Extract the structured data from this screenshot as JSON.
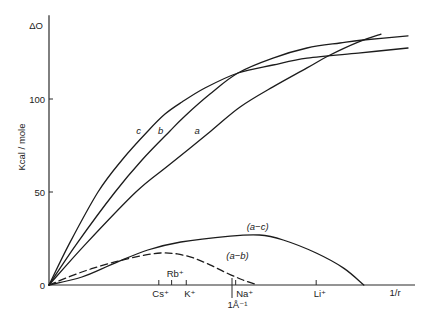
{
  "chart_data": {
    "type": "line",
    "title": "",
    "xlabel": "1/r",
    "ylabel": "Kcal / mole",
    "y_top_label": "ΔO",
    "xlim": [
      0,
      2.0
    ],
    "ylim": [
      0,
      145
    ],
    "grid": false,
    "legend": "none (curves labeled inline)",
    "y_ticks": [
      {
        "value": 0,
        "label": "0"
      },
      {
        "value": 50,
        "label": "50"
      },
      {
        "value": 100,
        "label": "100"
      }
    ],
    "x_markers": [
      {
        "label": "Cs⁺",
        "x": 0.6,
        "label_x": 0.61,
        "label_pos": "below",
        "long": false
      },
      {
        "label": "Rb⁺",
        "x": 0.67,
        "label_x": 0.69,
        "label_pos": "above",
        "long": false
      },
      {
        "label": "K⁺",
        "x": 0.75,
        "label_x": 0.77,
        "label_pos": "below",
        "long": false
      },
      {
        "label": "1Å⁻¹",
        "x": 1.0,
        "label_x": 1.03,
        "label_pos": "below2",
        "long": true
      },
      {
        "label": "Na⁺",
        "x": 1.02,
        "label_x": 1.07,
        "label_pos": "below",
        "long": false
      },
      {
        "label": "Li⁺",
        "x": 1.46,
        "label_x": 1.48,
        "label_pos": "below",
        "long": false
      }
    ],
    "series": [
      {
        "name": "a",
        "style": "solid",
        "points": [
          [
            0,
            0
          ],
          [
            0.2,
            22
          ],
          [
            0.475,
            50
          ],
          [
            0.656,
            64.5
          ],
          [
            0.885,
            82.8
          ],
          [
            1.044,
            95.7
          ],
          [
            1.224,
            106.5
          ],
          [
            1.41,
            116.7
          ],
          [
            1.525,
            123.1
          ],
          [
            1.689,
            130.6
          ],
          [
            1.814,
            134.9
          ]
        ]
      },
      {
        "name": "b",
        "style": "solid",
        "points": [
          [
            0,
            0
          ],
          [
            0.15,
            22
          ],
          [
            0.361,
            50
          ],
          [
            0.508,
            67.2
          ],
          [
            0.661,
            82.8
          ],
          [
            0.743,
            90.9
          ],
          [
            0.88,
            102.7
          ],
          [
            1.033,
            114
          ],
          [
            1.224,
            122
          ],
          [
            1.41,
            127.4
          ],
          [
            1.59,
            130.1
          ],
          [
            1.716,
            131.7
          ],
          [
            1.962,
            133.9
          ]
        ]
      },
      {
        "name": "c",
        "style": "solid",
        "points": [
          [
            0,
            0
          ],
          [
            0.11,
            22
          ],
          [
            0.268,
            50
          ],
          [
            0.399,
            67.2
          ],
          [
            0.541,
            82.8
          ],
          [
            0.634,
            91.9
          ],
          [
            0.727,
            98.4
          ],
          [
            0.852,
            105.9
          ],
          [
            1.033,
            114
          ],
          [
            1.224,
            118.3
          ],
          [
            1.41,
            122
          ],
          [
            1.689,
            124.7
          ],
          [
            1.962,
            127.4
          ]
        ]
      },
      {
        "name": "(a−c)",
        "style": "solid",
        "points": [
          [
            0,
            0
          ],
          [
            0.18,
            4.3
          ],
          [
            0.36,
            11.8
          ],
          [
            0.54,
            18.8
          ],
          [
            0.72,
            23.1
          ],
          [
            0.99,
            26.3
          ],
          [
            1.15,
            26.9
          ],
          [
            1.28,
            24.2
          ],
          [
            1.46,
            17.2
          ],
          [
            1.61,
            9.1
          ],
          [
            1.72,
            0
          ]
        ]
      },
      {
        "name": "(a−b)",
        "style": "dashed",
        "points": [
          [
            0,
            0
          ],
          [
            0.18,
            7.0
          ],
          [
            0.36,
            12.4
          ],
          [
            0.5,
            15.6
          ],
          [
            0.61,
            17.2
          ],
          [
            0.7,
            16.7
          ],
          [
            0.79,
            14.5
          ],
          [
            0.88,
            10.8
          ],
          [
            0.97,
            6.5
          ],
          [
            1.06,
            2.7
          ],
          [
            1.14,
            0
          ]
        ]
      }
    ],
    "annotations": [
      {
        "text": "c",
        "x": 0.49,
        "y": 82.8,
        "italic": true
      },
      {
        "text": "b",
        "x": 0.61,
        "y": 82.8,
        "italic": true
      },
      {
        "text": "a",
        "x": 0.81,
        "y": 82.8,
        "italic": true
      },
      {
        "text": "(a−c)",
        "x": 1.14,
        "y": 31.7,
        "italic": true
      },
      {
        "text": "(a−b)",
        "x": 1.03,
        "y": 15.6,
        "italic": true
      }
    ]
  }
}
